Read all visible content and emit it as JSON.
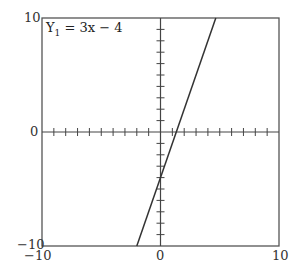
{
  "chart_data": {
    "type": "line",
    "title": "",
    "equation_label": "Y",
    "equation_sub": "1",
    "equation_rhs": " = 3x − 4",
    "series": [
      {
        "name": "Y1 = 3x − 4",
        "slope": 3,
        "intercept": -4,
        "x": [
          -2,
          4.667
        ],
        "y": [
          -10,
          10
        ]
      }
    ],
    "xlim": [
      -10,
      10
    ],
    "ylim": [
      -10,
      10
    ],
    "xticks": [
      -10,
      0,
      10
    ],
    "yticks": [
      -10,
      0,
      10
    ],
    "tick_step": 1,
    "xlabel": "",
    "ylabel": "",
    "grid": false
  },
  "labels": {
    "y_top": "10",
    "y_mid": "0",
    "y_bot": "−10",
    "x_left": "−10",
    "x_mid": "0",
    "x_right": "10"
  }
}
